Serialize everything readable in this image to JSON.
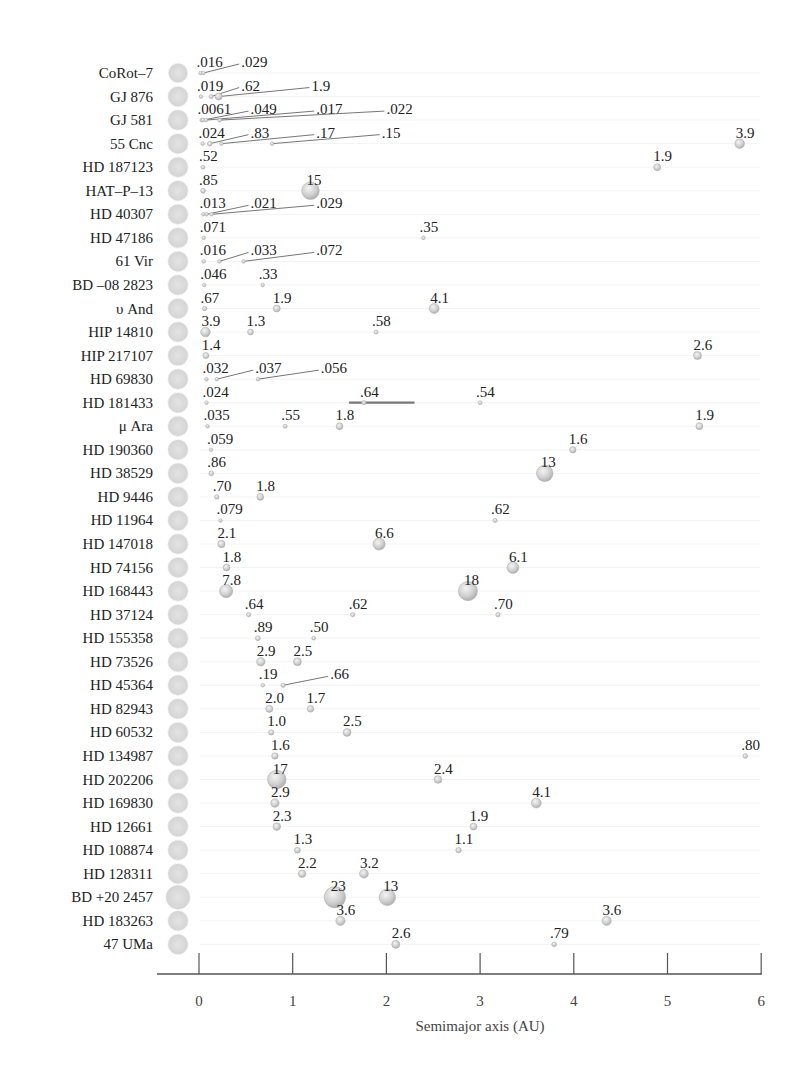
{
  "chart_data": {
    "type": "scatter",
    "subtype": "bubble-rows",
    "title": "",
    "xlabel": "Semimajor axis (AU)",
    "ylabel": "",
    "xlim": [
      -0.3,
      6
    ],
    "xticks": [
      0,
      1,
      2,
      3,
      4,
      5,
      6
    ],
    "grid": false,
    "legend": null,
    "note": "Each row is a multi-planet system; bubble labels are planet masses (Jupiter/Earth units as printed). Star shown as gray disc at left.",
    "colors": {
      "star": "#d6d6d6",
      "planet": "#cfcfcf",
      "planet_edge": "#a8a8a8",
      "leader": "#666666",
      "axis": "#555555",
      "text": "#222222"
    },
    "systems": [
      {
        "name": "CoRot–7",
        "planets": [
          {
            "a": 0.017,
            "mass": ".016",
            "lx": 0.0
          },
          {
            "a": 0.046,
            "mass": ".029",
            "lx": 0.45
          }
        ]
      },
      {
        "name": "GJ 876",
        "planets": [
          {
            "a": 0.021,
            "mass": ".019",
            "lx": 0.0
          },
          {
            "a": 0.13,
            "mass": ".62",
            "lx": 0.45
          },
          {
            "a": 0.21,
            "mass": "1.9",
            "lx": 1.2
          }
        ]
      },
      {
        "name": "GJ 581",
        "planets": [
          {
            "a": 0.028,
            "mass": ".0061",
            "lx": 0.0
          },
          {
            "a": 0.041,
            "mass": ".049",
            "lx": 0.55
          },
          {
            "a": 0.073,
            "mass": ".017",
            "lx": 1.25
          },
          {
            "a": 0.22,
            "mass": ".022",
            "lx": 2.0
          }
        ]
      },
      {
        "name": "55 Cnc",
        "planets": [
          {
            "a": 0.038,
            "mass": ".024",
            "lx": 0.0
          },
          {
            "a": 0.115,
            "mass": ".83",
            "lx": 0.55
          },
          {
            "a": 0.24,
            "mass": ".17",
            "lx": 1.25
          },
          {
            "a": 0.78,
            "mass": ".15",
            "lx": 1.95
          },
          {
            "a": 5.77,
            "mass": "3.9",
            "lx": 5.77
          }
        ]
      },
      {
        "name": "HD 187123",
        "planets": [
          {
            "a": 0.042,
            "mass": ".52",
            "lx": 0.0
          },
          {
            "a": 4.89,
            "mass": "1.9",
            "lx": 4.89
          }
        ]
      },
      {
        "name": "HAT–P–13",
        "planets": [
          {
            "a": 0.043,
            "mass": ".85",
            "lx": 0.0
          },
          {
            "a": 1.19,
            "mass": "15",
            "lx": 1.19
          }
        ]
      },
      {
        "name": "HD 40307",
        "planets": [
          {
            "a": 0.047,
            "mass": ".013",
            "lx": 0.0
          },
          {
            "a": 0.081,
            "mass": ".021",
            "lx": 0.55
          },
          {
            "a": 0.134,
            "mass": ".029",
            "lx": 1.25
          }
        ]
      },
      {
        "name": "HD 47186",
        "planets": [
          {
            "a": 0.05,
            "mass": ".071",
            "lx": 0.0
          },
          {
            "a": 2.395,
            "mass": ".35",
            "lx": 2.395
          }
        ]
      },
      {
        "name": "61 Vir",
        "planets": [
          {
            "a": 0.05,
            "mass": ".016",
            "lx": 0.0
          },
          {
            "a": 0.217,
            "mass": ".033",
            "lx": 0.55
          },
          {
            "a": 0.476,
            "mass": ".072",
            "lx": 1.25
          }
        ]
      },
      {
        "name": "BD –08 2823",
        "planets": [
          {
            "a": 0.056,
            "mass": ".046",
            "lx": 0.0
          },
          {
            "a": 0.68,
            "mass": ".33",
            "lx": 0.68
          }
        ]
      },
      {
        "name": "υ And",
        "planets": [
          {
            "a": 0.059,
            "mass": ".67",
            "lx": 0.0
          },
          {
            "a": 0.83,
            "mass": "1.9",
            "lx": 0.83
          },
          {
            "a": 2.51,
            "mass": "4.1",
            "lx": 2.51
          }
        ]
      },
      {
        "name": "HIP 14810",
        "planets": [
          {
            "a": 0.069,
            "mass": "3.9",
            "lx": 0.069
          },
          {
            "a": 0.55,
            "mass": "1.3",
            "lx": 0.55
          },
          {
            "a": 1.89,
            "mass": ".58",
            "lx": 1.89
          }
        ]
      },
      {
        "name": "HIP 217107",
        "planets": [
          {
            "a": 0.073,
            "mass": "1.4",
            "lx": 0.073
          },
          {
            "a": 5.32,
            "mass": "2.6",
            "lx": 5.32
          }
        ]
      },
      {
        "name": "HD 69830",
        "planets": [
          {
            "a": 0.079,
            "mass": ".032",
            "lx": 0.0
          },
          {
            "a": 0.19,
            "mass": ".037",
            "lx": 0.6
          },
          {
            "a": 0.63,
            "mass": ".056",
            "lx": 1.3
          }
        ]
      },
      {
        "name": "HD 181433",
        "planets": [
          {
            "a": 0.08,
            "mass": ".024",
            "lx": 0.0
          },
          {
            "a": 1.76,
            "mass": ".64",
            "lx": 1.76,
            "range": [
              1.6,
              2.3
            ]
          },
          {
            "a": 3.0,
            "mass": ".54",
            "lx": 3.0
          }
        ]
      },
      {
        "name": "μ Ara",
        "planets": [
          {
            "a": 0.091,
            "mass": ".035",
            "lx": 0.091
          },
          {
            "a": 0.92,
            "mass": ".55",
            "lx": 0.92
          },
          {
            "a": 1.5,
            "mass": "1.8",
            "lx": 1.5
          },
          {
            "a": 5.34,
            "mass": "1.9",
            "lx": 5.34
          }
        ]
      },
      {
        "name": "HD 190360",
        "planets": [
          {
            "a": 0.128,
            "mass": ".059",
            "lx": 0.128
          },
          {
            "a": 3.99,
            "mass": "1.6",
            "lx": 3.99
          }
        ]
      },
      {
        "name": "HD 38529",
        "planets": [
          {
            "a": 0.131,
            "mass": ".86",
            "lx": 0.131
          },
          {
            "a": 3.69,
            "mass": "13",
            "lx": 3.69
          }
        ]
      },
      {
        "name": "HD 9446",
        "planets": [
          {
            "a": 0.189,
            "mass": ".70",
            "lx": 0.189
          },
          {
            "a": 0.654,
            "mass": "1.8",
            "lx": 0.654
          }
        ]
      },
      {
        "name": "HD 11964",
        "planets": [
          {
            "a": 0.229,
            "mass": ".079",
            "lx": 0.229
          },
          {
            "a": 3.16,
            "mass": ".62",
            "lx": 3.16
          }
        ]
      },
      {
        "name": "HD 147018",
        "planets": [
          {
            "a": 0.239,
            "mass": "2.1",
            "lx": 0.239
          },
          {
            "a": 1.922,
            "mass": "6.6",
            "lx": 1.922
          }
        ]
      },
      {
        "name": "HD 74156",
        "planets": [
          {
            "a": 0.294,
            "mass": "1.8",
            "lx": 0.294
          },
          {
            "a": 3.35,
            "mass": "6.1",
            "lx": 3.35
          }
        ]
      },
      {
        "name": "HD 168443",
        "planets": [
          {
            "a": 0.29,
            "mass": "7.8",
            "lx": 0.29
          },
          {
            "a": 2.87,
            "mass": "18",
            "lx": 2.87
          }
        ]
      },
      {
        "name": "HD 37124",
        "planets": [
          {
            "a": 0.53,
            "mass": ".64",
            "lx": 0.53
          },
          {
            "a": 1.64,
            "mass": ".62",
            "lx": 1.64
          },
          {
            "a": 3.19,
            "mass": ".70",
            "lx": 3.19
          }
        ]
      },
      {
        "name": "HD 155358",
        "planets": [
          {
            "a": 0.628,
            "mass": ".89",
            "lx": 0.628
          },
          {
            "a": 1.224,
            "mass": ".50",
            "lx": 1.224
          }
        ]
      },
      {
        "name": "HD 73526",
        "planets": [
          {
            "a": 0.66,
            "mass": "2.9",
            "lx": 0.66
          },
          {
            "a": 1.05,
            "mass": "2.5",
            "lx": 1.05
          }
        ]
      },
      {
        "name": "HD 45364",
        "planets": [
          {
            "a": 0.681,
            "mass": ".19",
            "lx": 0.681
          },
          {
            "a": 0.897,
            "mass": ".66",
            "lx": 1.4
          }
        ]
      },
      {
        "name": "HD 82943",
        "planets": [
          {
            "a": 0.75,
            "mass": "2.0",
            "lx": 0.75
          },
          {
            "a": 1.19,
            "mass": "1.7",
            "lx": 1.19
          }
        ]
      },
      {
        "name": "HD 60532",
        "planets": [
          {
            "a": 0.77,
            "mass": "1.0",
            "lx": 0.77
          },
          {
            "a": 1.58,
            "mass": "2.5",
            "lx": 1.58
          }
        ]
      },
      {
        "name": "HD 134987",
        "planets": [
          {
            "a": 0.81,
            "mass": "1.6",
            "lx": 0.81
          },
          {
            "a": 5.83,
            "mass": ".80",
            "lx": 5.83
          }
        ]
      },
      {
        "name": "HD 202206",
        "planets": [
          {
            "a": 0.83,
            "mass": "17",
            "lx": 0.83
          },
          {
            "a": 2.55,
            "mass": "2.4",
            "lx": 2.55
          }
        ]
      },
      {
        "name": "HD 169830",
        "planets": [
          {
            "a": 0.81,
            "mass": "2.9",
            "lx": 0.81
          },
          {
            "a": 3.6,
            "mass": "4.1",
            "lx": 3.6
          }
        ]
      },
      {
        "name": "HD 12661",
        "planets": [
          {
            "a": 0.83,
            "mass": "2.3",
            "lx": 0.83
          },
          {
            "a": 2.93,
            "mass": "1.9",
            "lx": 2.93
          }
        ]
      },
      {
        "name": "HD 108874",
        "planets": [
          {
            "a": 1.05,
            "mass": "1.3",
            "lx": 1.05
          },
          {
            "a": 2.77,
            "mass": "1.1",
            "lx": 2.77
          }
        ]
      },
      {
        "name": "HD 128311",
        "planets": [
          {
            "a": 1.1,
            "mass": "2.2",
            "lx": 1.1
          },
          {
            "a": 1.76,
            "mass": "3.2",
            "lx": 1.76
          }
        ]
      },
      {
        "name": "BD +20 2457",
        "planets": [
          {
            "a": 1.45,
            "mass": "23",
            "lx": 1.45
          },
          {
            "a": 2.01,
            "mass": "13",
            "lx": 2.01
          }
        ]
      },
      {
        "name": "HD 183263",
        "planets": [
          {
            "a": 1.51,
            "mass": "3.6",
            "lx": 1.51
          },
          {
            "a": 4.35,
            "mass": "3.6",
            "lx": 4.35
          }
        ]
      },
      {
        "name": "47 UMa",
        "planets": [
          {
            "a": 2.1,
            "mass": "2.6",
            "lx": 2.1
          },
          {
            "a": 3.79,
            "mass": ".79",
            "lx": 3.79
          }
        ]
      }
    ]
  },
  "axis": {
    "title": "Semimajor axis (AU)",
    "ticks": [
      "0",
      "1",
      "2",
      "3",
      "4",
      "5",
      "6"
    ]
  }
}
